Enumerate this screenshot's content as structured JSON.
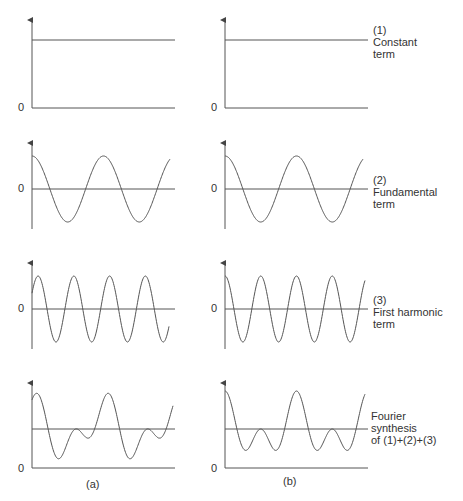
{
  "figure": {
    "panels": [
      {
        "id": 1,
        "label_lines": [
          "(1)",
          "Constant",
          "term"
        ]
      },
      {
        "id": 2,
        "label_lines": [
          "(2)",
          "Fundamental",
          "term"
        ]
      },
      {
        "id": 3,
        "label_lines": [
          "(3)",
          "First harmonic",
          "term"
        ]
      },
      {
        "id": 4,
        "label_lines": [
          "Fourier",
          "synthesis",
          "of (1)+(2)+(3)"
        ]
      }
    ],
    "zero_label": "0",
    "captions": {
      "left": "(a)",
      "right": "(b)"
    },
    "colors": {
      "line": "#555555",
      "text": "#333333",
      "background": "#ffffff"
    }
  },
  "chart_data": {
    "type": "line",
    "title": "",
    "columns": [
      "(a)",
      "(b)"
    ],
    "rows": [
      {
        "name": "(1) Constant term",
        "a": "y = c (constant, above 0)",
        "b": "y = c (constant, above 0)"
      },
      {
        "name": "(2) Fundamental term",
        "a": "A·cos(ωt), 2 periods",
        "b": "A·cos(ωt), 2 periods"
      },
      {
        "name": "(3) First harmonic term",
        "a": "A·sin(2ωt + φ) starting near zero rising, 4 periods",
        "b": "A·cos(2ωt), 4 periods starting at max"
      },
      {
        "name": "Fourier synthesis of (1)+(2)+(3)",
        "a": "sum, asymmetric peaks",
        "b": "sum, symmetric peaks"
      }
    ],
    "x": {
      "label": "",
      "range": [
        0,
        4
      ],
      "units": "half-periods of fundamental"
    },
    "y": {
      "label": "",
      "tick_labels": [
        "0"
      ]
    },
    "grid": false,
    "legend": "labels to the right of column (b)"
  }
}
